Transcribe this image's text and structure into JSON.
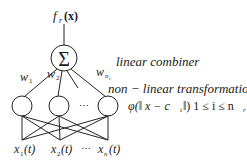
{
  "diagram": {
    "type": "rbf-network",
    "output": {
      "func": "f",
      "sub": "r",
      "arg": "(x)"
    },
    "combiner": {
      "symbol": "Σ",
      "label": "linear combiner"
    },
    "weights": [
      {
        "base": "w",
        "sub": "1"
      },
      {
        "base": "w",
        "sub": "2"
      },
      {
        "base": "w",
        "sub": "n",
        "subsub": "r"
      }
    ],
    "hidden": {
      "count_visible": 3,
      "ellipsis": "⋯",
      "label": "non − linear transformation",
      "formula": "φ(‖ x − c",
      "formula_sub": "i",
      "formula_tail": " ‖) 1 ≤ i ≤ n",
      "formula_tail_sub": "r"
    },
    "inputs": [
      {
        "base": "x",
        "sub": "1",
        "arg": "(t)"
      },
      {
        "base": "x",
        "sub": "2",
        "arg": "(t)"
      },
      {
        "base": "x",
        "sub": "n",
        "arg": "(t)"
      }
    ],
    "inputs_ellipsis": "⋯"
  }
}
